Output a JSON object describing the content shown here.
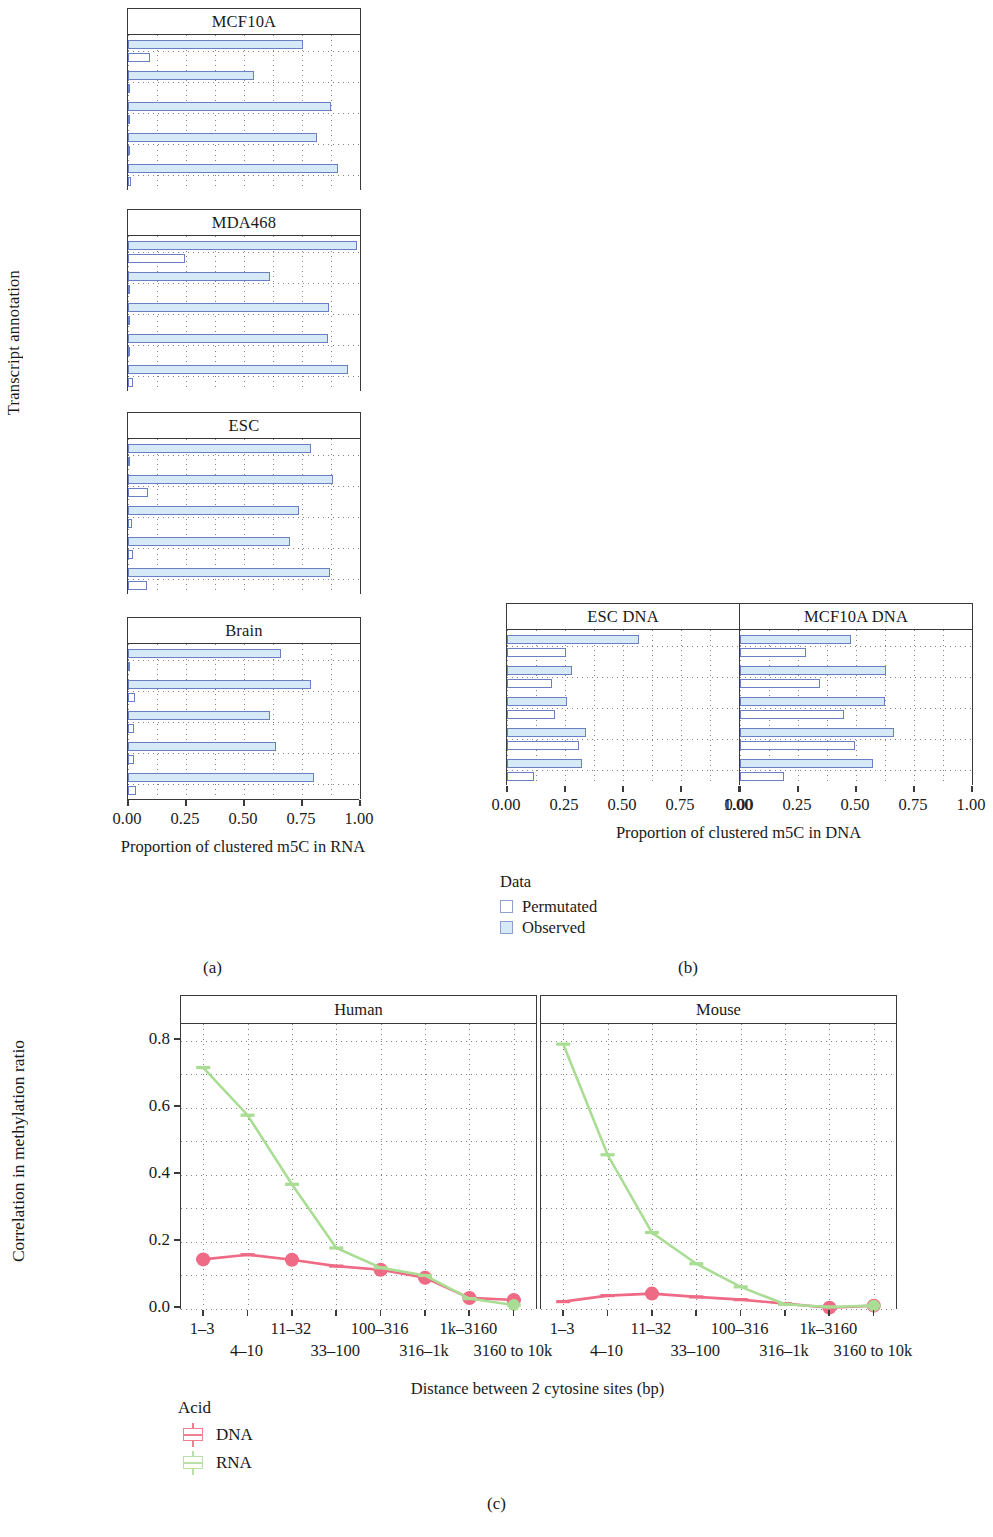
{
  "figure": {
    "captions": {
      "a": "(a)",
      "b": "(b)",
      "c": "(c)"
    }
  },
  "panel_a": {
    "y_axis_title": "Transcript annotation",
    "x_axis_title": "Proportion of clustered m5C in RNA",
    "x_ticks": [
      "0.00",
      "0.25",
      "0.50",
      "0.75",
      "1.00"
    ],
    "categories": [
      "sncRNA",
      "lncRNA",
      "3′UTR",
      "CDS",
      "5′UTR"
    ],
    "facets": [
      "MCF10A",
      "MDA468",
      "ESC",
      "Brain"
    ]
  },
  "panel_b": {
    "x_axis_title": "Proportion of clustered m5C in DNA",
    "x_ticks": [
      "0.00",
      "0.25",
      "0.50",
      "0.75",
      "1.00"
    ],
    "categories": [
      "sncRNA",
      "lncRNA",
      "3′UTR",
      "CDS",
      "5′UTR"
    ],
    "facets": [
      "ESC DNA",
      "MCF10A DNA"
    ]
  },
  "legend_data": {
    "title": "Data",
    "items": [
      {
        "label": "Permutated",
        "key": "permutated",
        "color": "#ffffff",
        "border": "#8f9fd0"
      },
      {
        "label": "Observed",
        "key": "observed",
        "color": "#d5e9f7",
        "border": "#8f9fd0"
      }
    ]
  },
  "legend_acid": {
    "title": "Acid",
    "items": [
      {
        "label": "DNA",
        "color": "#f07f91"
      },
      {
        "label": "RNA",
        "color": "#b8e0a8"
      }
    ]
  },
  "panel_c": {
    "y_axis_title": "Correlation in methylation ratio",
    "x_axis_title": "Distance between 2 cytosine sites (bp)",
    "facets": [
      "Human",
      "Mouse"
    ]
  },
  "chart_data": [
    {
      "type": "bar",
      "id": "panel-a-MCF10A",
      "title": "MCF10A",
      "xlabel": "Proportion of clustered m5C in RNA",
      "ylabel": "Transcript annotation",
      "xlim": [
        0,
        1
      ],
      "grid": true,
      "orientation": "horizontal",
      "categories": [
        "sncRNA",
        "lncRNA",
        "3′UTR",
        "CDS",
        "5′UTR"
      ],
      "series": [
        {
          "name": "Observed",
          "values": [
            0.755,
            0.545,
            0.875,
            0.815,
            0.905
          ]
        },
        {
          "name": "Permutated",
          "values": [
            0.095,
            0.006,
            0.008,
            0.006,
            0.015
          ]
        }
      ]
    },
    {
      "type": "bar",
      "id": "panel-a-MDA468",
      "title": "MDA468",
      "xlabel": "Proportion of clustered m5C in RNA",
      "ylabel": "Transcript annotation",
      "xlim": [
        0,
        1
      ],
      "grid": true,
      "orientation": "horizontal",
      "categories": [
        "sncRNA",
        "lncRNA",
        "3′UTR",
        "CDS",
        "5′UTR"
      ],
      "series": [
        {
          "name": "Observed",
          "values": [
            0.985,
            0.61,
            0.865,
            0.86,
            0.95
          ]
        },
        {
          "name": "Permutated",
          "values": [
            0.245,
            0.01,
            0.008,
            0.008,
            0.022
          ]
        }
      ]
    },
    {
      "type": "bar",
      "id": "panel-a-ESC",
      "title": "ESC",
      "xlabel": "Proportion of clustered m5C in RNA",
      "ylabel": "Transcript annotation",
      "xlim": [
        0,
        1
      ],
      "grid": true,
      "orientation": "horizontal",
      "categories": [
        "sncRNA",
        "lncRNA",
        "3′UTR",
        "CDS",
        "5′UTR"
      ],
      "series": [
        {
          "name": "Observed",
          "values": [
            0.79,
            0.885,
            0.735,
            0.7,
            0.87
          ]
        },
        {
          "name": "Permutated",
          "values": [
            0.01,
            0.085,
            0.018,
            0.022,
            0.08
          ]
        }
      ]
    },
    {
      "type": "bar",
      "id": "panel-a-Brain",
      "title": "Brain",
      "xlabel": "Proportion of clustered m5C in RNA",
      "ylabel": "Transcript annotation",
      "xlim": [
        0,
        1
      ],
      "grid": true,
      "orientation": "horizontal",
      "categories": [
        "sncRNA",
        "lncRNA",
        "3′UTR",
        "CDS",
        "5′UTR"
      ],
      "series": [
        {
          "name": "Observed",
          "values": [
            0.66,
            0.79,
            0.61,
            0.64,
            0.8
          ]
        },
        {
          "name": "Permutated",
          "values": [
            0.006,
            0.03,
            0.026,
            0.026,
            0.035
          ]
        }
      ]
    },
    {
      "type": "bar",
      "id": "panel-b-ESC-DNA",
      "title": "ESC DNA",
      "xlabel": "Proportion of clustered m5C in DNA",
      "ylabel": "Transcript annotation",
      "xlim": [
        0,
        1
      ],
      "grid": true,
      "orientation": "horizontal",
      "categories": [
        "sncRNA",
        "lncRNA",
        "3′UTR",
        "CDS",
        "5′UTR"
      ],
      "series": [
        {
          "name": "Observed",
          "values": [
            0.57,
            0.28,
            0.26,
            0.34,
            0.325
          ]
        },
        {
          "name": "Permutated",
          "values": [
            0.255,
            0.195,
            0.205,
            0.31,
            0.115
          ]
        }
      ]
    },
    {
      "type": "bar",
      "id": "panel-b-MCF10A-DNA",
      "title": "MCF10A DNA",
      "xlabel": "Proportion of clustered m5C in DNA",
      "ylabel": "Transcript annotation",
      "xlim": [
        0,
        1
      ],
      "grid": true,
      "orientation": "horizontal",
      "categories": [
        "sncRNA",
        "lncRNA",
        "3′UTR",
        "CDS",
        "5′UTR"
      ],
      "series": [
        {
          "name": "Observed",
          "values": [
            0.48,
            0.63,
            0.625,
            0.665,
            0.575
          ]
        },
        {
          "name": "Permutated",
          "values": [
            0.285,
            0.345,
            0.45,
            0.495,
            0.19
          ]
        }
      ]
    },
    {
      "type": "line",
      "id": "panel-c-Human",
      "title": "Human",
      "xlabel": "Distance between 2 cytosine sites (bp)",
      "ylabel": "Correlation in methylation ratio",
      "ylim": [
        0,
        0.85
      ],
      "y_ticks": [
        "0.0",
        "0.2",
        "0.4",
        "0.6",
        "0.8"
      ],
      "grid": true,
      "legend_position": "bottom-left",
      "x": [
        "1–3",
        "4–10",
        "11–32",
        "33–100",
        "100–316",
        "316–1k",
        "1k–3160",
        "3160 to 10k"
      ],
      "series": [
        {
          "name": "DNA",
          "color": "#ef6a84",
          "values": [
            0.148,
            0.162,
            0.147,
            0.128,
            0.117,
            0.093,
            0.033,
            0.027
          ]
        },
        {
          "name": "RNA",
          "color": "#a9dd94",
          "values": [
            0.72,
            0.578,
            0.372,
            0.182,
            0.123,
            0.1,
            0.031,
            0.012
          ]
        }
      ]
    },
    {
      "type": "line",
      "id": "panel-c-Mouse",
      "title": "Mouse",
      "xlabel": "Distance between 2 cytosine sites (bp)",
      "ylabel": "Correlation in methylation ratio",
      "ylim": [
        0,
        0.85
      ],
      "y_ticks": [
        "0.0",
        "0.2",
        "0.4",
        "0.6",
        "0.8"
      ],
      "grid": true,
      "legend_position": "bottom-left",
      "x": [
        "1–3",
        "4–10",
        "11–32",
        "33–100",
        "100–316",
        "316–1k",
        "1k–3160",
        "3160 to 10k"
      ],
      "series": [
        {
          "name": "DNA",
          "color": "#ef6a84",
          "values": [
            0.022,
            0.04,
            0.046,
            0.036,
            0.028,
            0.016,
            0.004,
            0.01
          ]
        },
        {
          "name": "RNA",
          "color": "#a9dd94",
          "values": [
            0.79,
            0.46,
            0.228,
            0.135,
            0.066,
            0.014,
            0.006,
            0.01
          ]
        }
      ]
    }
  ],
  "panel_c_x_rows": {
    "row1": [
      "1–3",
      "11–32",
      "100–316",
      "1k–3160"
    ],
    "row2": [
      "4–10",
      "33–100",
      "316–1k",
      "3160 to 10k"
    ]
  }
}
